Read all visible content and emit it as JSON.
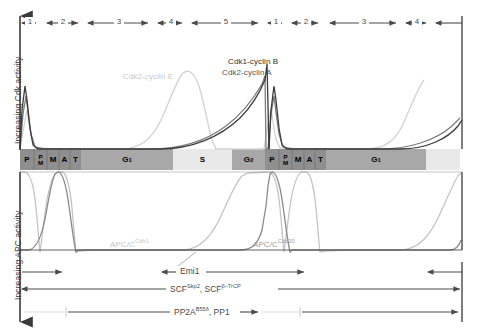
{
  "figure": {
    "type": "cell-cycle-activity-diagram",
    "axes": {
      "cdk_axis_label": "Increasing Cdk activity",
      "apc_axis_label": "Increasing APC activity"
    },
    "segment_numbers": {
      "cycle1": [
        "1",
        "2",
        "3",
        "4",
        "5"
      ],
      "cycle2": [
        "1",
        "2",
        "3",
        "4"
      ]
    },
    "phase_bar": [
      {
        "label": "P",
        "sub": "",
        "shade": "dark",
        "x": 20,
        "w": 14
      },
      {
        "label": "P/M",
        "sub": "",
        "shade": "dark",
        "x": 34,
        "w": 13,
        "stacked": [
          "P",
          "M"
        ]
      },
      {
        "label": "M",
        "sub": "",
        "shade": "dark",
        "x": 47,
        "w": 12
      },
      {
        "label": "A",
        "sub": "",
        "shade": "dark",
        "x": 59,
        "w": 11
      },
      {
        "label": "T",
        "sub": "",
        "shade": "dark",
        "x": 70,
        "w": 11
      },
      {
        "label": "G",
        "sub": "1",
        "shade": "medium",
        "x": 81,
        "w": 92
      },
      {
        "label": "S",
        "sub": "",
        "shade": "light",
        "x": 173,
        "w": 59
      },
      {
        "label": "G",
        "sub": "2",
        "shade": "medium",
        "x": 232,
        "w": 33
      },
      {
        "label": "P",
        "sub": "",
        "shade": "dark",
        "x": 265,
        "w": 14
      },
      {
        "label": "P/M",
        "sub": "",
        "shade": "dark",
        "x": 279,
        "w": 13,
        "stacked": [
          "P",
          "M"
        ]
      },
      {
        "label": "M",
        "sub": "",
        "shade": "dark",
        "x": 292,
        "w": 12
      },
      {
        "label": "A",
        "sub": "",
        "shade": "dark",
        "x": 304,
        "w": 11
      },
      {
        "label": "T",
        "sub": "",
        "shade": "dark",
        "x": 315,
        "w": 11
      },
      {
        "label": "G",
        "sub": "1",
        "shade": "medium",
        "x": 326,
        "w": 100
      },
      {
        "label": "",
        "sub": "",
        "shade": "light",
        "x": 426,
        "w": 34
      }
    ],
    "curve_labels": [
      {
        "name": "cdk2-cyclin-e",
        "text": "Cdk2-cyclin E",
        "x": 123,
        "y": 72,
        "color": "#c9c9c9"
      },
      {
        "name": "cdk2-cyclin-a",
        "text": "Cdk2-cyclin A",
        "x": 222,
        "y": 68,
        "color": "#555555"
      },
      {
        "name": "cdk1-cyclin-b",
        "text": "Cdk1-cyclin B",
        "x": 228,
        "y": 57,
        "color": "#333333"
      },
      {
        "name": "apc-cdh1",
        "text": "APC/C",
        "sup": "Cdh1",
        "x": 110,
        "y": 238,
        "color": "#c4c4c4"
      },
      {
        "name": "apc-cdc20",
        "text": "APC/C",
        "sup": "Cdc20",
        "x": 253,
        "y": 238,
        "color": "#9a9a9a"
      }
    ],
    "annotations": [
      {
        "name": "emi1",
        "text": "Emi1",
        "sup": "",
        "x": 176,
        "y": 270
      },
      {
        "name": "scf",
        "text": "SCF",
        "sup": "Skp2",
        "text2": ", SCF",
        "sup2": "β–TrCP",
        "x": 168,
        "y": 287
      },
      {
        "name": "pp2a",
        "text": "PP2A",
        "sup": "B55δ",
        "text2": ", PP1",
        "x": 172,
        "y": 310
      }
    ],
    "colors": {
      "bar_dark": "#8f8f8f",
      "bar_medium": "#a8a8a8",
      "bar_light": "#e6e6e6",
      "axis": "#3a3a3a",
      "cdk1_cyclin_b": "#3c3c3c",
      "cdk2_cyclin_a": "#7a7a7a",
      "cdk2_cyclin_e": "#d0d0d0",
      "apc_cdh1": "#c0c0c0",
      "apc_cdc20": "#8a8a8a",
      "annotation_line": "#4a4a4a",
      "annotation_line_light": "#e0e0e0"
    }
  }
}
